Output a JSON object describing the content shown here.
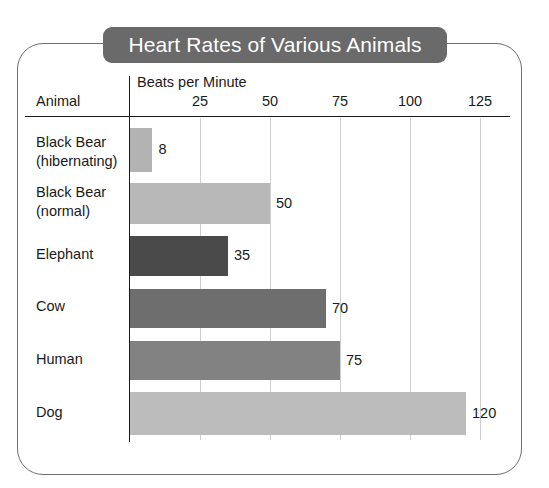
{
  "chart_data": {
    "type": "bar",
    "orientation": "horizontal",
    "title": "Heart Rates of Various Animals",
    "xlabel": "Beats per Minute",
    "ylabel": "Animal",
    "xlim": [
      0,
      130
    ],
    "xticks": [
      25,
      50,
      75,
      100,
      125
    ],
    "xtick_labels": [
      "25",
      "50",
      "75",
      "100",
      "125"
    ],
    "grid": "vertical",
    "legend": "none",
    "categories": [
      "Black Bear\n(hibernating)",
      "Black Bear\n(normal)",
      "Elephant",
      "Cow",
      "Human",
      "Dog"
    ],
    "values": [
      8,
      50,
      35,
      70,
      75,
      120
    ],
    "value_labels": [
      "8",
      "50",
      "35",
      "70",
      "75",
      "120"
    ],
    "bar_colors": [
      "#b3b3b3",
      "#b8b8b8",
      "#4a4a4a",
      "#6e6e6e",
      "#828282",
      "#bcbcbc"
    ]
  },
  "title_banner": {
    "text": "Heart Rates of Various Animals",
    "background": "#6a6a6a",
    "text_color": "#ffffff"
  },
  "axes": {
    "animal_header": "Animal",
    "beats_header": "Beats per Minute",
    "axis_color": "#1a1a1a",
    "grid_color": "#cfcfcf"
  },
  "frame": {
    "border_color": "#6f6f6f"
  }
}
